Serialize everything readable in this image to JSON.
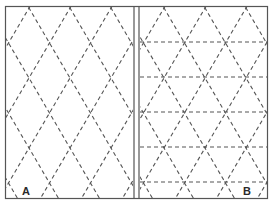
{
  "figure": {
    "panels": [
      {
        "label": "A",
        "pattern": "diamond lattice"
      },
      {
        "label": "B",
        "pattern": "triangle grid"
      }
    ],
    "colors": {
      "border": "#555555",
      "dash": "#555555",
      "background": "#ffffff",
      "label": "#2a2a2a"
    }
  }
}
